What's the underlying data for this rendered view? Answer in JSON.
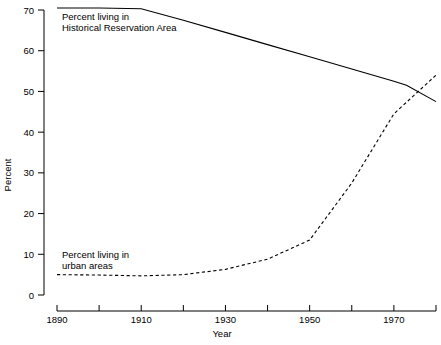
{
  "chart_data": {
    "type": "line",
    "title": "",
    "xlabel": "Year",
    "ylabel": "Percent",
    "xlim": [
      1890,
      1980
    ],
    "ylim": [
      0,
      70
    ],
    "grid": false,
    "legend_position": "inline-annotation",
    "x_ticks": [
      1890,
      1910,
      1930,
      1950,
      1970
    ],
    "x_minor_ticks": [
      1900,
      1920,
      1940,
      1960,
      1980
    ],
    "y_ticks": [
      0,
      10,
      20,
      30,
      40,
      50,
      60,
      70
    ],
    "series": [
      {
        "name": "Percent living in Historical Reservation Area",
        "style": "solid",
        "annotation_line1": "Percent living in",
        "annotation_line2": "Historical Reservation Area",
        "x": [
          1890,
          1900,
          1910,
          1920,
          1930,
          1940,
          1950,
          1960,
          1970,
          1973,
          1980
        ],
        "values": [
          70.5,
          70.5,
          70.3,
          67.5,
          64.5,
          61.5,
          58.5,
          55.5,
          52.5,
          51.5,
          47.5
        ]
      },
      {
        "name": "Percent living in urban areas",
        "style": "dashed",
        "annotation_line1": "Percent living in",
        "annotation_line2": "urban areas",
        "x": [
          1890,
          1900,
          1910,
          1920,
          1930,
          1940,
          1950,
          1960,
          1970,
          1980
        ],
        "values": [
          5.0,
          4.9,
          4.7,
          5.0,
          6.3,
          8.8,
          13.5,
          27.5,
          44.5,
          54.0
        ]
      }
    ]
  },
  "axis": {
    "y_title": "Percent",
    "x_title": "Year",
    "y_tick_labels": [
      "0",
      "10",
      "20",
      "30",
      "40",
      "50",
      "60",
      "70"
    ],
    "x_tick_labels": [
      "1890",
      "1910",
      "1930",
      "1950",
      "1970"
    ]
  },
  "annotations": {
    "solid_label_line1": "Percent living in",
    "solid_label_line2": "Historical Reservation Area",
    "dashed_label_line1": "Percent living in",
    "dashed_label_line2": "urban areas"
  },
  "colors": {
    "background": "#ffffff",
    "line": "#000000",
    "text": "#000000"
  }
}
